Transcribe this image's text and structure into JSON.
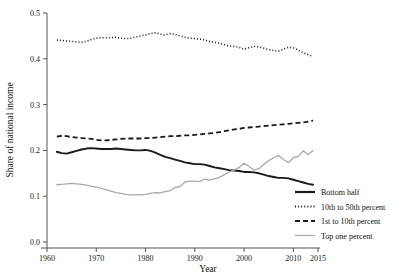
{
  "chart_data": {
    "type": "line",
    "title": "",
    "xlabel": "Year",
    "ylabel": "Share of national income",
    "xlim": [
      1960,
      2015
    ],
    "ylim": [
      0.0,
      0.5
    ],
    "xticks": [
      1960,
      1970,
      1980,
      1990,
      2000,
      2010,
      2015
    ],
    "yticks": [
      0.0,
      0.1,
      0.2,
      0.3,
      0.4,
      0.5
    ],
    "xtick_labels": [
      "1960",
      "1970",
      "1980",
      "1990",
      "2000",
      "2010",
      "2015"
    ],
    "ytick_labels": [
      "0.0",
      "0.1",
      "0.2",
      "0.3",
      "0.4",
      "0.5"
    ],
    "grid": false,
    "legend_position": "lower-right",
    "x": [
      1962,
      1963,
      1964,
      1965,
      1966,
      1967,
      1968,
      1969,
      1970,
      1971,
      1972,
      1973,
      1974,
      1975,
      1976,
      1977,
      1978,
      1979,
      1980,
      1981,
      1982,
      1983,
      1984,
      1985,
      1986,
      1987,
      1988,
      1989,
      1990,
      1991,
      1992,
      1993,
      1994,
      1995,
      1996,
      1997,
      1998,
      1999,
      2000,
      2001,
      2002,
      2003,
      2004,
      2005,
      2006,
      2007,
      2008,
      2009,
      2010,
      2011,
      2012,
      2013,
      2014
    ],
    "series": [
      {
        "name": "Bottom half",
        "style": "solid",
        "color": "#1a1a1a",
        "width": 1.9,
        "values": [
          0.197,
          0.194,
          0.193,
          0.196,
          0.199,
          0.202,
          0.204,
          0.205,
          0.204,
          0.203,
          0.203,
          0.203,
          0.204,
          0.203,
          0.202,
          0.201,
          0.2,
          0.2,
          0.201,
          0.199,
          0.195,
          0.19,
          0.186,
          0.183,
          0.18,
          0.177,
          0.174,
          0.172,
          0.17,
          0.17,
          0.169,
          0.166,
          0.163,
          0.161,
          0.159,
          0.157,
          0.156,
          0.155,
          0.153,
          0.153,
          0.152,
          0.15,
          0.147,
          0.144,
          0.142,
          0.14,
          0.14,
          0.139,
          0.136,
          0.133,
          0.13,
          0.127,
          0.125
        ]
      },
      {
        "name": "10th to 50th percent",
        "style": "dotted",
        "color": "#1a1a1a",
        "width": 1.6,
        "values": [
          0.441,
          0.44,
          0.439,
          0.438,
          0.437,
          0.436,
          0.438,
          0.442,
          0.445,
          0.446,
          0.446,
          0.446,
          0.447,
          0.445,
          0.444,
          0.445,
          0.448,
          0.45,
          0.452,
          0.455,
          0.457,
          0.454,
          0.452,
          0.455,
          0.453,
          0.45,
          0.447,
          0.445,
          0.444,
          0.443,
          0.441,
          0.438,
          0.436,
          0.434,
          0.431,
          0.428,
          0.427,
          0.425,
          0.421,
          0.424,
          0.427,
          0.426,
          0.423,
          0.42,
          0.418,
          0.417,
          0.421,
          0.425,
          0.424,
          0.419,
          0.413,
          0.409,
          0.405
        ]
      },
      {
        "name": "1st to 10th percent",
        "style": "dashed",
        "color": "#1a1a1a",
        "width": 1.8,
        "values": [
          0.23,
          0.232,
          0.231,
          0.229,
          0.228,
          0.227,
          0.226,
          0.225,
          0.223,
          0.222,
          0.222,
          0.223,
          0.224,
          0.225,
          0.226,
          0.226,
          0.226,
          0.226,
          0.227,
          0.227,
          0.228,
          0.229,
          0.23,
          0.231,
          0.231,
          0.232,
          0.233,
          0.233,
          0.234,
          0.235,
          0.236,
          0.237,
          0.238,
          0.24,
          0.242,
          0.244,
          0.246,
          0.247,
          0.249,
          0.25,
          0.251,
          0.252,
          0.253,
          0.254,
          0.255,
          0.256,
          0.257,
          0.258,
          0.259,
          0.26,
          0.261,
          0.263,
          0.265
        ]
      },
      {
        "name": "Top one percent",
        "style": "solid-light",
        "color": "#aaaaaa",
        "width": 1.3,
        "values": [
          0.125,
          0.126,
          0.127,
          0.128,
          0.127,
          0.126,
          0.124,
          0.122,
          0.12,
          0.117,
          0.114,
          0.111,
          0.108,
          0.106,
          0.104,
          0.103,
          0.103,
          0.103,
          0.104,
          0.106,
          0.108,
          0.107,
          0.11,
          0.112,
          0.119,
          0.121,
          0.131,
          0.133,
          0.133,
          0.132,
          0.137,
          0.135,
          0.138,
          0.141,
          0.147,
          0.153,
          0.157,
          0.163,
          0.172,
          0.165,
          0.157,
          0.16,
          0.169,
          0.178,
          0.184,
          0.189,
          0.18,
          0.173,
          0.184,
          0.187,
          0.199,
          0.191,
          0.2
        ]
      }
    ],
    "legend": [
      {
        "label": "Bottom half",
        "style": "solid",
        "color": "#1a1a1a"
      },
      {
        "label": "10th to 50th percent",
        "style": "dotted",
        "color": "#1a1a1a"
      },
      {
        "label": "1st to 10th percent",
        "style": "dashed",
        "color": "#1a1a1a"
      },
      {
        "label": "Top one percent",
        "style": "solid-light",
        "color": "#aaaaaa"
      }
    ]
  }
}
